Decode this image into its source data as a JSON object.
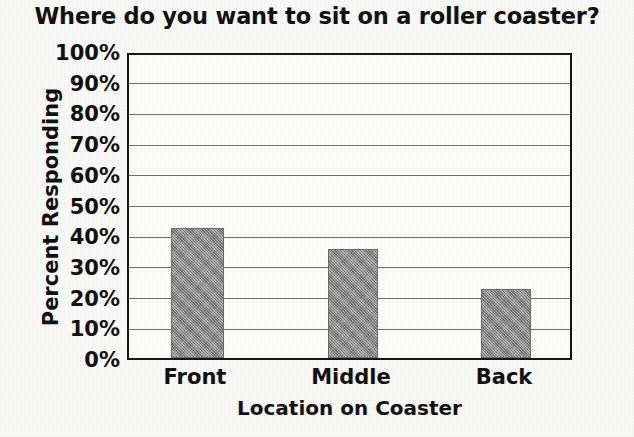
{
  "chart_data": {
    "type": "bar",
    "title": "Where do you want to sit on a roller coaster?",
    "xlabel": "Location on Coaster",
    "ylabel": "Percent Responding",
    "categories": [
      "Front",
      "Middle",
      "Back"
    ],
    "values": [
      43,
      36,
      23
    ],
    "value_labels": [
      "43%",
      "36%",
      "23%"
    ],
    "ylim": [
      0,
      100
    ],
    "ytick_values": [
      0,
      10,
      20,
      30,
      40,
      50,
      60,
      70,
      80,
      90,
      100
    ],
    "ytick_labels": [
      "0%",
      "10%",
      "20%",
      "30%",
      "40%",
      "50%",
      "60%",
      "70%",
      "80%",
      "90%",
      "100%"
    ],
    "grid": true,
    "grid_axis": "y",
    "legend": false,
    "legend_position": "none",
    "series": [
      {
        "name": "Percent Responding",
        "values": [
          43,
          36,
          23
        ],
        "color": "#8a8a8a"
      }
    ],
    "colors": {
      "bar_fill": "#8a8a8a",
      "bar_edge": "#6c6c6c",
      "axis_frame": "#151515",
      "gridline": "#6f6f6f",
      "text": "#111111",
      "plot_background": "#fbfbfa",
      "page_background": "#f8f8f6"
    }
  }
}
